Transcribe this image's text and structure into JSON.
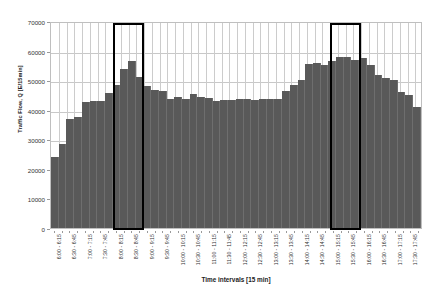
{
  "chart_data": {
    "type": "bar",
    "title": "",
    "xlabel": "Time intervals [15 min]",
    "ylabel": "Traffic Flow, Q [E/15min]",
    "ylim": [
      0,
      70000
    ],
    "ytick_values": [
      0,
      10000,
      20000,
      30000,
      40000,
      50000,
      60000,
      70000
    ],
    "ytick_labels": [
      "0",
      "10000",
      "20000",
      "30000",
      "40000",
      "50000",
      "60000",
      "70000"
    ],
    "grid": "horizontal-and-vertical",
    "legend": "none",
    "bar_color": "#595959",
    "highlight_color": "#000000",
    "categories": [
      "6:00 - 6:15",
      "6:15 - 6:30",
      "6:30 - 6:45",
      "6:45 - 7:00",
      "7:00 - 7:15",
      "7:15 - 7:30",
      "7:30 - 7:45",
      "7:45 - 8:00",
      "8:00 - 8:15",
      "8:15 - 8:30",
      "8:30 - 8:45",
      "8:45 - 9:00",
      "9:00 - 9:15",
      "9:15 - 9:30",
      "9:30 - 9:45",
      "9:45 - 10:00",
      "10:00 - 10:15",
      "10:15 - 10:30",
      "10:30 - 10:45",
      "10:45 - 11:00",
      "11:00 - 11:15",
      "11:15 - 11:30",
      "11:30 - 11:45",
      "11:45 - 12:00",
      "12:00 - 12:15",
      "12:15 - 12:30",
      "12:30 - 12:45",
      "12:45 - 13:00",
      "13:00 - 13:15",
      "13:15 - 13:30",
      "13:30 - 13:45",
      "13:45 - 14:00",
      "14:00 - 14:15",
      "14:15 - 14:30",
      "14:30 - 14:45",
      "14:45 - 15:00",
      "15:00 - 15:15",
      "15:15 - 15:30",
      "15:30 - 15:45",
      "15:45 - 16:00",
      "16:00 - 16:15",
      "16:15 - 16:30",
      "16:30 - 16:45",
      "16:45 - 17:00",
      "17:00 - 17:15",
      "17:15 - 17:30",
      "17:30 - 17:45",
      "17:45 - 18:00"
    ],
    "tick_label_interval": 2,
    "values": [
      24300,
      28600,
      37100,
      37800,
      43100,
      43300,
      43500,
      46000,
      48900,
      54400,
      57100,
      51400,
      48400,
      47000,
      46700,
      44000,
      44600,
      44200,
      45600,
      44800,
      44400,
      43300,
      43600,
      43800,
      43900,
      44200,
      43800,
      44000,
      44100,
      43900,
      46900,
      49000,
      50400,
      56100,
      56400,
      55700,
      57000,
      58300,
      58400,
      57400,
      58200,
      55700,
      52300,
      51300,
      50500,
      46600,
      45500,
      41300
    ],
    "highlights": [
      {
        "label": "morning-peak",
        "start_index": 8,
        "end_index": 11,
        "start_time": "8:00",
        "end_time": "9:00",
        "top_value": 70000
      },
      {
        "label": "afternoon-peak",
        "start_index": 36,
        "end_index": 39,
        "start_time": "16:00",
        "end_time": "17:00",
        "top_value": 70000
      }
    ]
  }
}
